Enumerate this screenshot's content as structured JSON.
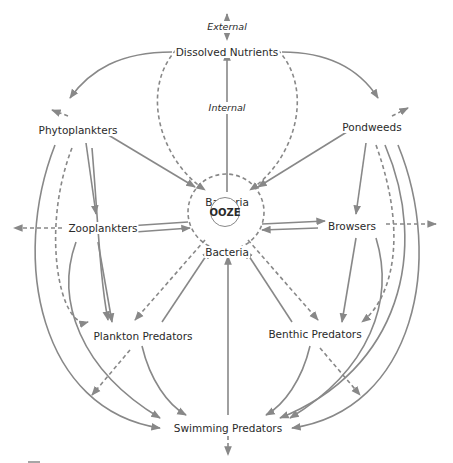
{
  "diagram": {
    "nodes": {
      "external": "External",
      "dissolved_nutrients": "Dissolved Nutrients",
      "internal": "Internal",
      "phytoplankters": "Phytoplankters",
      "pondweeds": "Pondweeds",
      "bacteria_top": "Bacteria",
      "ooze": "OOZE",
      "bacteria_bottom": "Bacteria",
      "zooplankters": "Zooplankters",
      "browsers": "Browsers",
      "plankton_predators": "Plankton Predators",
      "benthic_predators": "Benthic Predators",
      "swimming_predators": "Swimming Predators"
    },
    "legend": {
      "solid": "feeding / transfer flow",
      "dashed": "decomposition / export flow"
    },
    "colors": {
      "line": "#888888",
      "text": "#2a2a2a",
      "background": "#ffffff"
    }
  }
}
